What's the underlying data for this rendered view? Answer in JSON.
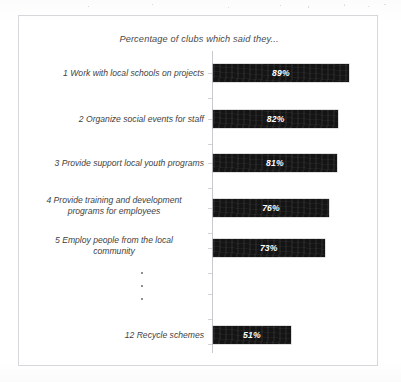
{
  "chart_data": {
    "type": "bar",
    "title": "Percentage of clubs which said they...",
    "xlabel": "",
    "ylabel": "",
    "orientation": "horizontal",
    "xlim": [
      0,
      100
    ],
    "grid": false,
    "legend": null,
    "value_suffix": "%",
    "categories": [
      "1 Work with local schools on projects",
      "2 Organize social events for staff",
      "3 Provide support local youth programs",
      "4 Provide training and development programs for employees",
      "5 Employ people from the local community",
      "12 Recycle schemes"
    ],
    "values": [
      89,
      82,
      81,
      76,
      73,
      51
    ],
    "value_labels": [
      "89%",
      "82%",
      "81%",
      "76%",
      "73%",
      "51%"
    ],
    "rows": [
      {
        "rank": "1",
        "label": "1 Work with local schools on projects",
        "label_lines": [
          "1 Work with local schools on projects"
        ],
        "value": 89,
        "value_label": "89%"
      },
      {
        "rank": "2",
        "label": "2 Organize social events for staff",
        "label_lines": [
          "2 Organize social events for staff"
        ],
        "value": 82,
        "value_label": "82%"
      },
      {
        "rank": "3",
        "label": "3 Provide support local youth programs",
        "label_lines": [
          "3 Provide support local youth programs"
        ],
        "value": 81,
        "value_label": "81%"
      },
      {
        "rank": "4",
        "label": "4 Provide training and development programs for employees",
        "label_lines": [
          "4 Provide training and development",
          "programs for employees"
        ],
        "value": 76,
        "value_label": "76%"
      },
      {
        "rank": "5",
        "label": "5 Employ people from the local community",
        "label_lines": [
          "5 Employ people from the local",
          "community"
        ],
        "value": 73,
        "value_label": "73%"
      },
      {
        "rank": "12",
        "label": "12 Recycle schemes",
        "label_lines": [
          "12 Recycle schemes"
        ],
        "value": 51,
        "value_label": "51%"
      }
    ],
    "truncation_marker": "vertical-ellipsis",
    "truncation_note": "rows 6 through 11 omitted",
    "colors": {
      "bar": "#141414",
      "bar_value_text": "#ffffff",
      "label_text": "#3f3f3f",
      "axis": "#c9c9cf",
      "frame": "#d8d8dc",
      "background": "#ffffff"
    }
  },
  "rows_geometry": [
    {
      "top": 48
    },
    {
      "top": 94
    },
    {
      "top": 138
    },
    {
      "top": 183
    },
    {
      "top": 223
    },
    {
      "top": 310
    }
  ]
}
